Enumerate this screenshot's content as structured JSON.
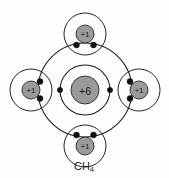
{
  "diagram": {
    "background_color": "#fdfdfc",
    "line_color": "#1a1a1a",
    "nucleus_fill": "#9a9a9a",
    "electron_color": "#111111",
    "caption": "CH",
    "caption_subscript": "4",
    "caption_full": "CH4"
  },
  "carbon": {
    "nucleus_charge": "+6",
    "center_x": 85,
    "center_y": 90,
    "nucleus_radius": 14,
    "inner_shell_radius": 25,
    "outer_shell_radius": 47,
    "inner_shell_electrons": 2,
    "bonding_pairs": 4
  },
  "hydrogens": [
    {
      "position_name": "top-hydrogen",
      "nucleus_charge": "+1",
      "center_x": 85,
      "center_y": 34,
      "nucleus_radius": 9,
      "shell_radius": 21
    },
    {
      "position_name": "left-hydrogen",
      "nucleus_charge": "+1",
      "center_x": 31,
      "center_y": 90,
      "nucleus_radius": 9,
      "shell_radius": 21
    },
    {
      "position_name": "right-hydrogen",
      "nucleus_charge": "+1",
      "center_x": 139,
      "center_y": 90,
      "nucleus_radius": 9,
      "shell_radius": 21
    },
    {
      "position_name": "bottom-hydrogen",
      "nucleus_charge": "+1",
      "center_x": 85,
      "center_y": 146,
      "nucleus_radius": 9,
      "shell_radius": 21
    }
  ],
  "inner_electrons": [
    {
      "name": "inner-electron-left",
      "x": 60,
      "y": 90
    },
    {
      "name": "inner-electron-right",
      "x": 110,
      "y": 90
    }
  ],
  "bond_electrons": [
    {
      "name": "bond-electron-top-left",
      "x": 76.5,
      "y": 45.0
    },
    {
      "name": "bond-electron-top-right",
      "x": 93.5,
      "y": 45.0
    },
    {
      "name": "bond-electron-left-upper",
      "x": 40.0,
      "y": 81.5
    },
    {
      "name": "bond-electron-left-lower",
      "x": 40.0,
      "y": 98.5
    },
    {
      "name": "bond-electron-right-upper",
      "x": 130.0,
      "y": 81.5
    },
    {
      "name": "bond-electron-right-lower",
      "x": 130.0,
      "y": 98.5
    },
    {
      "name": "bond-electron-bottom-left",
      "x": 76.5,
      "y": 135.0
    },
    {
      "name": "bond-electron-bottom-right",
      "x": 93.5,
      "y": 135.0
    }
  ]
}
